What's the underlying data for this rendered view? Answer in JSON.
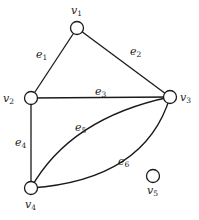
{
  "diagram": {
    "type": "graph",
    "nodes": [
      {
        "id": "v1",
        "name": "v",
        "sub": "1",
        "x": 77,
        "y": 28,
        "lx": 71,
        "ly": 14
      },
      {
        "id": "v2",
        "name": "v",
        "sub": "2",
        "x": 31,
        "y": 98,
        "lx": 3,
        "ly": 102
      },
      {
        "id": "v3",
        "name": "v",
        "sub": "3",
        "x": 170,
        "y": 97,
        "lx": 180,
        "ly": 101
      },
      {
        "id": "v4",
        "name": "v",
        "sub": "4",
        "x": 31,
        "y": 188,
        "lx": 25,
        "ly": 208
      },
      {
        "id": "v5",
        "name": "v",
        "sub": "5",
        "x": 153,
        "y": 176,
        "lx": 147,
        "ly": 194
      }
    ],
    "edges": [
      {
        "id": "e1",
        "name": "e",
        "sub": "1",
        "from": "v1",
        "to": "v2",
        "lx": 36,
        "ly": 58
      },
      {
        "id": "e2",
        "name": "e",
        "sub": "2",
        "from": "v1",
        "to": "v3",
        "lx": 130,
        "ly": 55
      },
      {
        "id": "e3",
        "name": "e",
        "sub": "3",
        "from": "v2",
        "to": "v3",
        "lx": 95,
        "ly": 95
      },
      {
        "id": "e4",
        "name": "e",
        "sub": "4",
        "from": "v2",
        "to": "v4",
        "lx": 15,
        "ly": 146
      },
      {
        "id": "e5",
        "name": "e",
        "sub": "5",
        "from": "v4",
        "to": "v3",
        "lx": 75,
        "ly": 131
      },
      {
        "id": "e6",
        "name": "e",
        "sub": "6",
        "from": "v4",
        "to": "v3",
        "lx": 118,
        "ly": 165
      }
    ],
    "node_radius": 6.5,
    "stroke_color": "#1a1a1a"
  }
}
